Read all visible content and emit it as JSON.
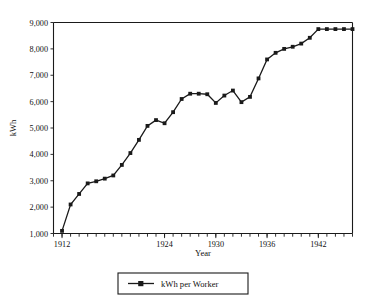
{
  "chart_data": {
    "type": "line",
    "title": "",
    "xlabel": "Year",
    "ylabel": "kWh",
    "xlim": [
      1911,
      1946
    ],
    "ylim": [
      1000,
      9000
    ],
    "grid": false,
    "legend_position": "bottom",
    "x_tick_labels": [
      "1912",
      "1924",
      "1930",
      "1936",
      "1942"
    ],
    "x_tick_values": [
      1912,
      1924,
      1930,
      1936,
      1942
    ],
    "x_minor_tick_interval": 1,
    "y_tick_labels": [
      "1,000",
      "2,000",
      "3,000",
      "4,000",
      "5,000",
      "6,000",
      "7,000",
      "8,000",
      "9,000"
    ],
    "y_tick_values": [
      1000,
      2000,
      3000,
      4000,
      5000,
      6000,
      7000,
      8000,
      9000
    ],
    "marker": "square",
    "line_color": "#1a1a1a",
    "x": [
      1912,
      1913,
      1914,
      1915,
      1916,
      1917,
      1918,
      1919,
      1920,
      1921,
      1922,
      1923,
      1924,
      1925,
      1926,
      1927,
      1928,
      1929,
      1930,
      1931,
      1932,
      1933,
      1934,
      1935,
      1936,
      1937,
      1938,
      1939,
      1940,
      1941,
      1942,
      1943,
      1944,
      1945,
      1946
    ],
    "series": [
      {
        "name": "kWh per Worker",
        "values": [
          1100,
          2100,
          2500,
          2900,
          2980,
          3080,
          3200,
          3600,
          4050,
          4550,
          5080,
          5300,
          5180,
          5600,
          6100,
          6300,
          6300,
          6280,
          5950,
          6230,
          6420,
          5980,
          6180,
          6880,
          7600,
          7850,
          8000,
          8080,
          8200,
          8420,
          8750,
          8750,
          8750,
          8750,
          8750
        ]
      }
    ]
  },
  "legend": {
    "entries": [
      {
        "label": "kWh per Worker"
      }
    ]
  }
}
